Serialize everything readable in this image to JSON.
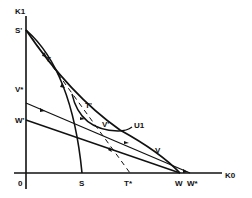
{
  "diagram": {
    "axes": {
      "y_label": "K1",
      "x_label": "K0",
      "origin_label": "0"
    },
    "x_axis_points": [
      {
        "id": "S",
        "label": "S"
      },
      {
        "id": "T_star",
        "label": "T*"
      },
      {
        "id": "W",
        "label": "W"
      },
      {
        "id": "W_star",
        "label": "W*"
      }
    ],
    "y_axis_points": [
      {
        "id": "S_prime",
        "label": "S'"
      },
      {
        "id": "V_star",
        "label": "V*"
      },
      {
        "id": "W_prime",
        "label": "W'"
      }
    ],
    "curve_points": [
      {
        "id": "T",
        "label": "T"
      },
      {
        "id": "T_prime",
        "label": "T'"
      },
      {
        "id": "V_prime",
        "label": "V'"
      },
      {
        "id": "V",
        "label": "V"
      }
    ],
    "indifference_curve": {
      "label": "U1"
    },
    "colors": {
      "ink": "#111111",
      "background": "#ffffff"
    }
  }
}
